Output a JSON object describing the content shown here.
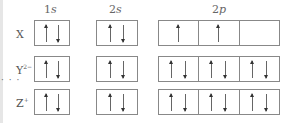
{
  "headers": [
    {
      "num": "1",
      "sub": "s"
    },
    {
      "num": "2",
      "sub": "s"
    },
    {
      "num": "2",
      "sub": "p"
    }
  ],
  "rows": [
    {
      "species": "X",
      "charge": "",
      "orbitals": {
        "1s": [
          "up",
          "down"
        ],
        "2s": [
          "up",
          "down"
        ],
        "2p": [
          [
            "up"
          ],
          [
            "up"
          ],
          []
        ]
      }
    },
    {
      "species": "Y",
      "charge": "2−",
      "orbitals": {
        "1s": [
          "up",
          "down"
        ],
        "2s": [
          "up",
          "down"
        ],
        "2p": [
          [
            "up",
            "down"
          ],
          [
            "up",
            "down"
          ],
          [
            "up",
            "down"
          ]
        ]
      }
    },
    {
      "species": "Z",
      "charge": "+",
      "orbitals": {
        "1s": [
          "up",
          "down"
        ],
        "2s": [
          "up",
          "down"
        ],
        "2p": [
          [
            "up",
            "down"
          ],
          [
            "up",
            "down"
          ],
          [
            "up",
            "down"
          ]
        ]
      }
    }
  ],
  "ellipsis": "· · ·"
}
